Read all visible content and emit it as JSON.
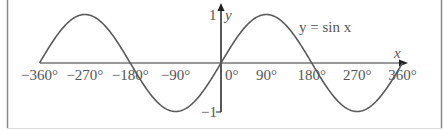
{
  "chart_data": {
    "type": "line",
    "title": "",
    "legend_label": "y = sin x",
    "xlabel": "x",
    "ylabel": "y",
    "x_ticks": [
      "−360°",
      "−270°",
      "−180°",
      "−90°",
      "0°",
      "90°",
      "180°",
      "270°",
      "360°"
    ],
    "x_tick_values": [
      -360,
      -270,
      -180,
      -90,
      0,
      90,
      180,
      270,
      360
    ],
    "y_ticks": [
      "1",
      "−1"
    ],
    "y_tick_values": [
      1,
      -1
    ],
    "xlim": [
      -360,
      360
    ],
    "ylim": [
      -1,
      1
    ],
    "grid": false,
    "series": [
      {
        "name": "y = sin x",
        "x": [
          -360,
          -315,
          -270,
          -225,
          -180,
          -135,
          -90,
          -45,
          0,
          45,
          90,
          135,
          180,
          225,
          270,
          315,
          360
        ],
        "values": [
          0,
          0.707,
          1,
          0.707,
          0,
          -0.707,
          -1,
          -0.707,
          0,
          0.707,
          1,
          0.707,
          0,
          -0.707,
          -1,
          -0.707,
          0
        ]
      }
    ],
    "colors": {
      "curve": "#555555",
      "axes": "#222222",
      "border": "#888888"
    }
  }
}
